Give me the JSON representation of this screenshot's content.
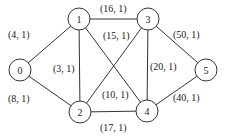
{
  "graph": {
    "nodes": [
      {
        "id": "0",
        "label": "0",
        "x": 20,
        "y": 70
      },
      {
        "id": "1",
        "label": "1",
        "x": 79,
        "y": 19
      },
      {
        "id": "2",
        "label": "2",
        "x": 80,
        "y": 112
      },
      {
        "id": "3",
        "label": "3",
        "x": 148,
        "y": 19
      },
      {
        "id": "4",
        "label": "4",
        "x": 147,
        "y": 111
      },
      {
        "id": "5",
        "label": "5",
        "x": 206,
        "y": 70
      }
    ],
    "edges": [
      {
        "from": "0",
        "to": "1",
        "label": "(4, 1)",
        "lx": 8,
        "ly": 34
      },
      {
        "from": "0",
        "to": "2",
        "label": "(8, 1)",
        "lx": 8,
        "ly": 98
      },
      {
        "from": "1",
        "to": "2",
        "label": "(3, 1)",
        "lx": 53,
        "ly": 68
      },
      {
        "from": "1",
        "to": "3",
        "label": "(16, 1)",
        "lx": 100,
        "ly": 8
      },
      {
        "from": "2",
        "to": "3",
        "label": "(15, 1)",
        "lx": 103,
        "ly": 35
      },
      {
        "from": "1",
        "to": "4",
        "label": "(10, 1)",
        "lx": 102,
        "ly": 94
      },
      {
        "from": "3",
        "to": "4",
        "label": "(20, 1)",
        "lx": 150,
        "ly": 66
      },
      {
        "from": "2",
        "to": "4",
        "label": "(17, 1)",
        "lx": 100,
        "ly": 127
      },
      {
        "from": "3",
        "to": "5",
        "label": "(50, 1)",
        "lx": 173,
        "ly": 34
      },
      {
        "from": "4",
        "to": "5",
        "label": "(40, 1)",
        "lx": 173,
        "ly": 97
      }
    ],
    "node_radius": 11,
    "colors": {
      "stroke": "#333333",
      "text": "#222222",
      "background": "#ffffff"
    }
  }
}
